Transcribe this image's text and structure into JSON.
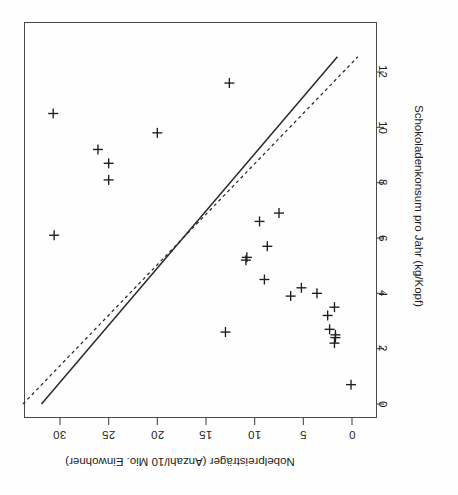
{
  "figure": {
    "caption_visible": false,
    "rotation_note": "chart rendered rotated 90 degrees clockwise (scanned page)",
    "ink_color": "#1d1d1d",
    "frame_color": "#4a4a4a",
    "background": "#ffffff"
  },
  "chart_data": {
    "type": "scatter",
    "title": "",
    "xlabel": "Schokoladenkonsum pro Jahr (kg/Kopf)",
    "ylabel": "Nobelpreisträger (Anzahl/10 Mio. Einwohner)",
    "xlim": [
      -0.35,
      12.6
    ],
    "ylim": [
      -1.2,
      32.2
    ],
    "xticks": [
      0,
      2,
      4,
      6,
      8,
      10,
      12
    ],
    "xticklabels": [
      "0",
      "2",
      "4",
      "6",
      "8",
      "10",
      "12"
    ],
    "yticks": [
      0,
      5,
      10,
      15,
      20,
      25,
      30
    ],
    "yticklabels": [
      "0",
      "5",
      "10",
      "15",
      "20",
      "25",
      "30"
    ],
    "grid": false,
    "legend": false,
    "marker": "plus",
    "points": [
      {
        "x": 11.6,
        "y": 12.6
      },
      {
        "x": 10.5,
        "y": 30.7
      },
      {
        "x": 9.8,
        "y": 20.0
      },
      {
        "x": 9.2,
        "y": 26.1
      },
      {
        "x": 8.7,
        "y": 25.0
      },
      {
        "x": 8.1,
        "y": 25.0
      },
      {
        "x": 6.9,
        "y": 7.5
      },
      {
        "x": 6.6,
        "y": 9.5
      },
      {
        "x": 6.1,
        "y": 30.6
      },
      {
        "x": 5.7,
        "y": 8.7
      },
      {
        "x": 5.3,
        "y": 10.8
      },
      {
        "x": 5.2,
        "y": 10.9
      },
      {
        "x": 4.5,
        "y": 9.0
      },
      {
        "x": 4.2,
        "y": 5.2
      },
      {
        "x": 4.0,
        "y": 3.6
      },
      {
        "x": 3.9,
        "y": 6.3
      },
      {
        "x": 3.5,
        "y": 1.8
      },
      {
        "x": 3.2,
        "y": 2.5
      },
      {
        "x": 2.7,
        "y": 2.3
      },
      {
        "x": 2.6,
        "y": 13.0
      },
      {
        "x": 2.5,
        "y": 1.7
      },
      {
        "x": 2.4,
        "y": 1.7
      },
      {
        "x": 2.2,
        "y": 1.8
      },
      {
        "x": 0.7,
        "y": 0.1
      }
    ],
    "lines": [
      {
        "name": "regression-solid",
        "style": "solid",
        "x0": 0.0,
        "y0": 31.9,
        "x1": 12.55,
        "y1": 1.5,
        "description": "durchgezogene Regressionsgerade"
      },
      {
        "name": "regression-dashed",
        "style": "dashed",
        "x0": 0.0,
        "y0": 33.8,
        "x1": 12.55,
        "y1": -0.6,
        "description": "gestrichelte Regressionsgerade"
      }
    ]
  }
}
